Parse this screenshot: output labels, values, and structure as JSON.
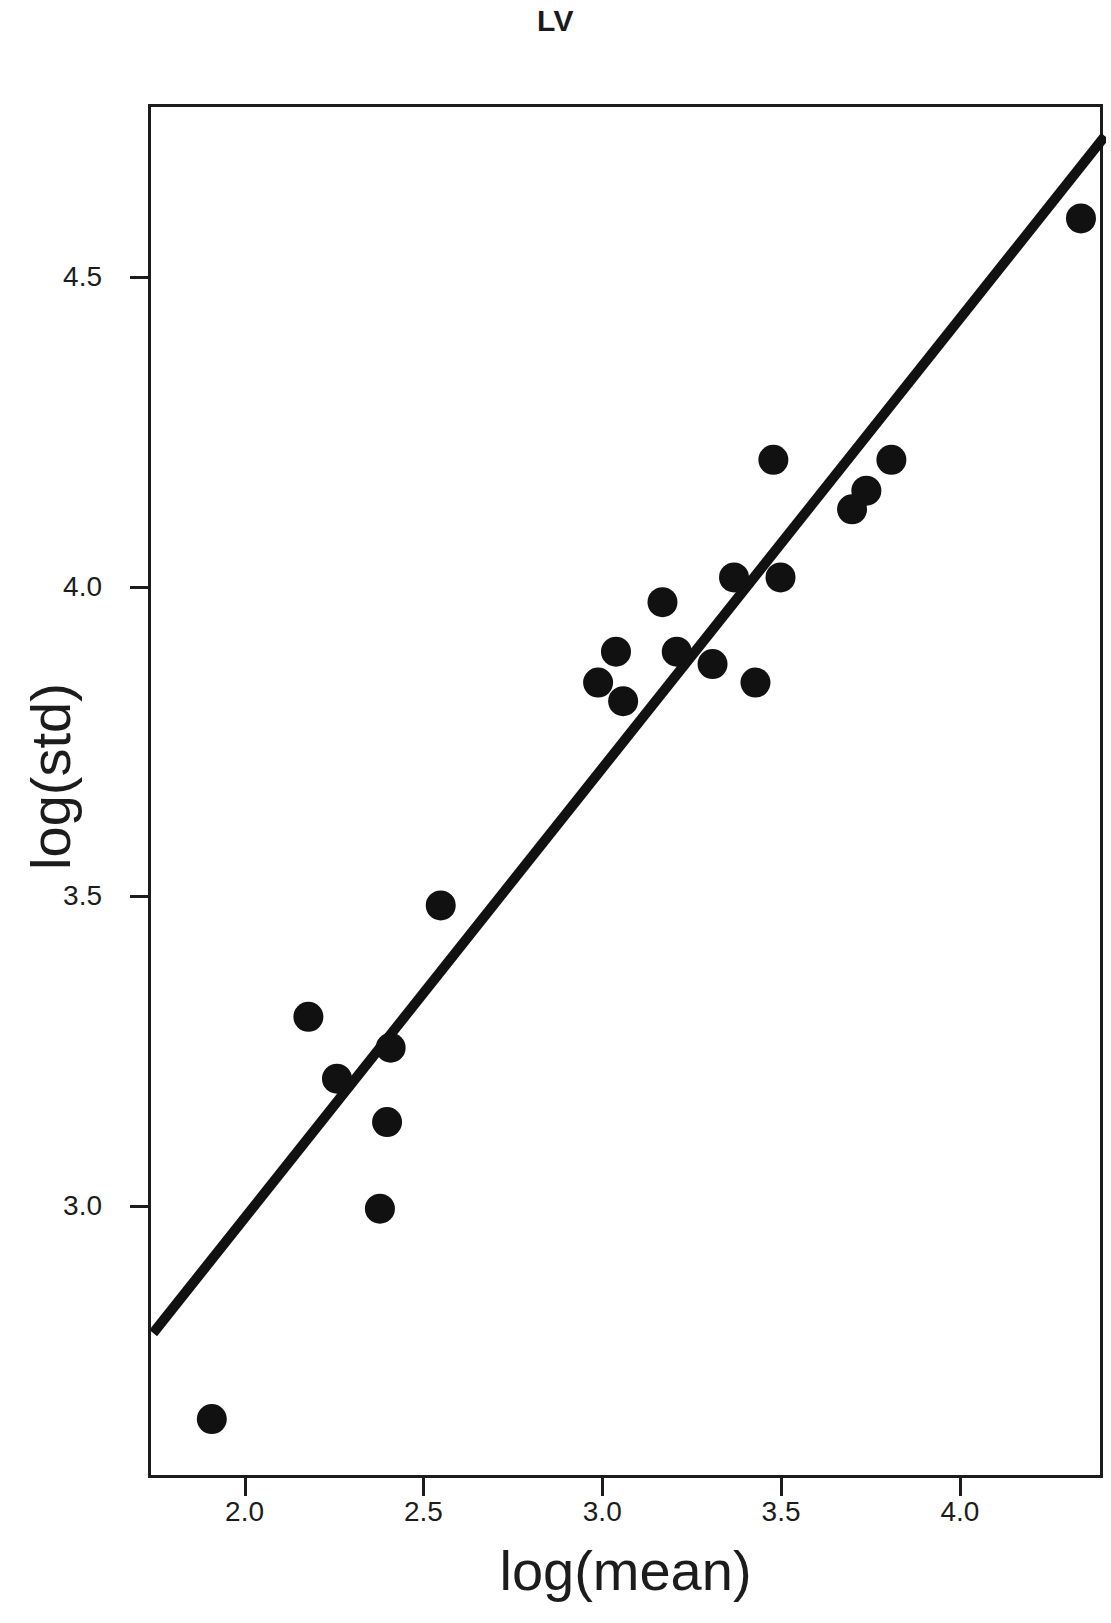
{
  "chart_data": {
    "type": "scatter",
    "title": "LV",
    "xlabel": "log(mean)",
    "ylabel": "log(std)",
    "xlim": [
      1.73,
      4.4
    ],
    "ylim": [
      2.56,
      4.78
    ],
    "grid": false,
    "legend": null,
    "xticks": [
      2.0,
      2.5,
      3.0,
      3.5,
      4.0
    ],
    "xtick_labels": [
      "2.0",
      "2.5",
      "3.0",
      "3.5",
      "4.0"
    ],
    "yticks": [
      3.0,
      3.5,
      4.0,
      4.5
    ],
    "ytick_labels": [
      "3.0",
      "3.5",
      "4.0",
      "4.5"
    ],
    "marker": {
      "shape": "circle",
      "color": "#111111",
      "size_px": 30
    },
    "x": [
      1.9,
      2.17,
      2.25,
      2.37,
      2.39,
      2.4,
      2.54,
      2.98,
      3.03,
      3.05,
      3.16,
      3.2,
      3.3,
      3.36,
      3.42,
      3.47,
      3.49,
      3.69,
      3.73,
      3.8,
      4.33
    ],
    "y": [
      2.66,
      3.31,
      3.21,
      3.0,
      3.14,
      3.26,
      3.49,
      3.85,
      3.9,
      3.82,
      3.98,
      3.9,
      3.88,
      4.02,
      3.85,
      4.21,
      4.02,
      4.13,
      4.16,
      4.21,
      4.6
    ],
    "points": [
      {
        "x": 1.9,
        "y": 2.66
      },
      {
        "x": 2.17,
        "y": 3.31
      },
      {
        "x": 2.25,
        "y": 3.21
      },
      {
        "x": 2.37,
        "y": 3.0
      },
      {
        "x": 2.39,
        "y": 3.14
      },
      {
        "x": 2.4,
        "y": 3.26
      },
      {
        "x": 2.54,
        "y": 3.49
      },
      {
        "x": 2.98,
        "y": 3.85
      },
      {
        "x": 3.03,
        "y": 3.9
      },
      {
        "x": 3.05,
        "y": 3.82
      },
      {
        "x": 3.16,
        "y": 3.98
      },
      {
        "x": 3.2,
        "y": 3.9
      },
      {
        "x": 3.3,
        "y": 3.88
      },
      {
        "x": 3.36,
        "y": 4.02
      },
      {
        "x": 3.42,
        "y": 3.85
      },
      {
        "x": 3.47,
        "y": 4.21
      },
      {
        "x": 3.49,
        "y": 4.02
      },
      {
        "x": 3.69,
        "y": 4.13
      },
      {
        "x": 3.73,
        "y": 4.16
      },
      {
        "x": 3.8,
        "y": 4.21
      },
      {
        "x": 4.33,
        "y": 4.6
      }
    ],
    "fit_line": {
      "type": "line",
      "color": "#111111",
      "width_px": 10,
      "x": [
        1.736,
        4.397
      ],
      "y": [
        2.799,
        4.733
      ]
    }
  }
}
